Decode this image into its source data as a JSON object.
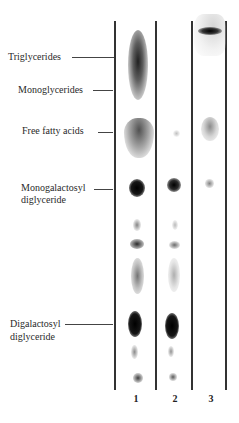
{
  "figure": {
    "labels": [
      {
        "id": "triglycerides",
        "text": "Triglycerides"
      },
      {
        "id": "monoglycerides",
        "text": "Monoglycerides"
      },
      {
        "id": "free-fatty-acids",
        "text": "Free fatty acids"
      },
      {
        "id": "mgdg",
        "line1": "Monogalactosyl",
        "line2": "diglyceride"
      },
      {
        "id": "dgdg",
        "line1": "Digalactosyl",
        "line2": "diglyceride"
      }
    ],
    "lanes": [
      {
        "number": "1"
      },
      {
        "number": "2"
      },
      {
        "number": "3"
      }
    ],
    "colors": {
      "line": "#333333",
      "spot": "#111111",
      "text": "#2a2a2a"
    }
  }
}
